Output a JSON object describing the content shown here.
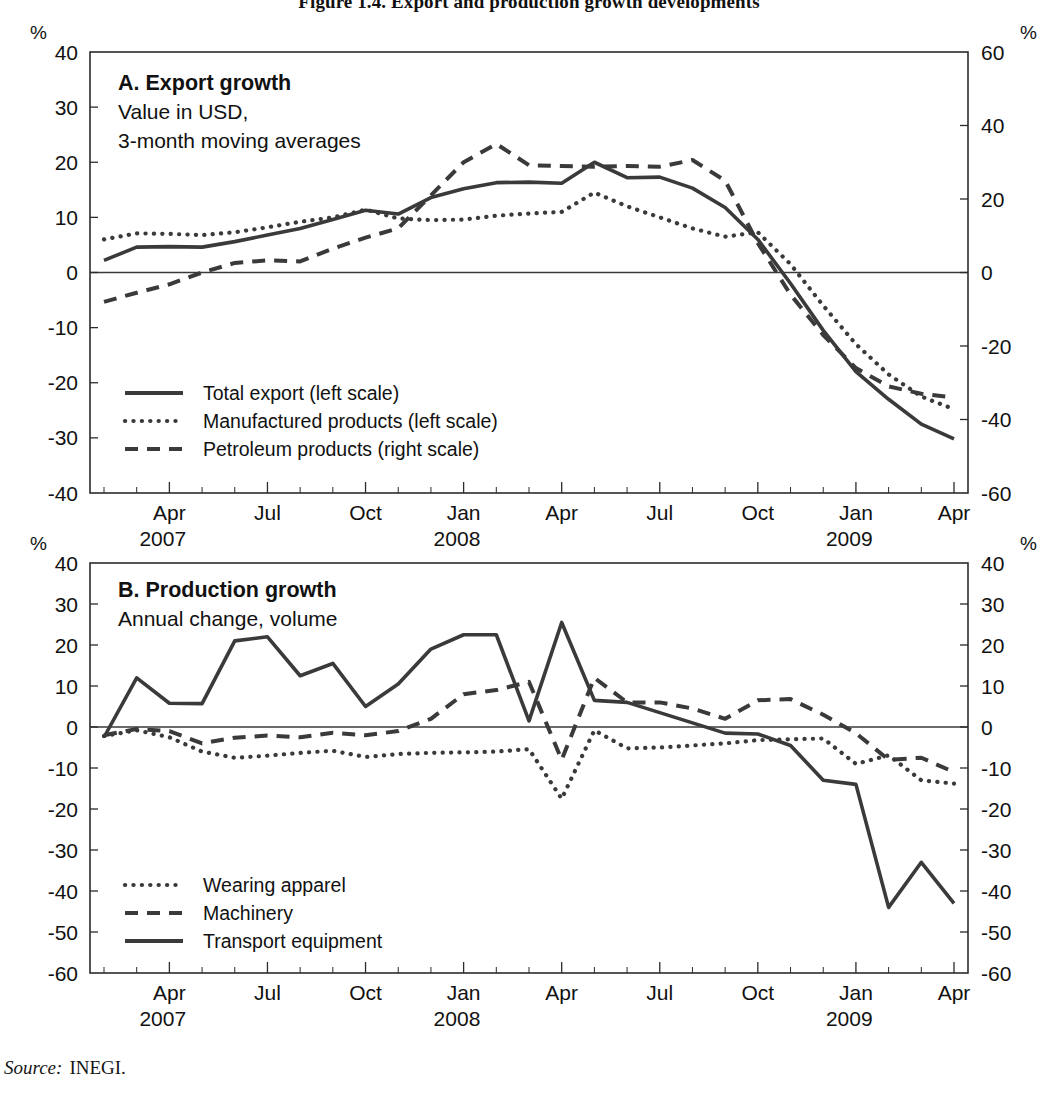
{
  "figure": {
    "title": "Figure 1.4. Export and production growth developments",
    "source_label": "Source:",
    "source_value": "INEGI."
  },
  "axis_unit": "%",
  "x_ticks": [
    "Apr",
    "Jul",
    "Oct",
    "Jan",
    "Apr",
    "Jul",
    "Oct",
    "Jan",
    "Apr"
  ],
  "years": [
    "2007",
    "2008",
    "2009"
  ],
  "chart_data": [
    {
      "type": "line",
      "panel": "A",
      "title": "A. Export growth",
      "subtitle_lines": [
        "Value in USD,",
        "3-month moving averages"
      ],
      "xlabel": "",
      "ylabel": "%",
      "y2label": "%",
      "ylim": [
        -40,
        40
      ],
      "y2lim": [
        -60,
        60
      ],
      "yticks": [
        40,
        30,
        20,
        10,
        0,
        -10,
        -20,
        -30,
        -40
      ],
      "y2ticks": [
        60,
        40,
        20,
        0,
        -20,
        -40,
        -60
      ],
      "grid": false,
      "legend_position": "inside-bottom-left",
      "x": [
        "2007-02",
        "2007-03",
        "2007-04",
        "2007-05",
        "2007-06",
        "2007-07",
        "2007-08",
        "2007-09",
        "2007-10",
        "2007-11",
        "2007-12",
        "2008-01",
        "2008-02",
        "2008-03",
        "2008-04",
        "2008-05",
        "2008-06",
        "2008-07",
        "2008-08",
        "2008-09",
        "2008-10",
        "2008-11",
        "2008-12",
        "2009-01",
        "2009-02",
        "2009-03",
        "2009-04"
      ],
      "series": [
        {
          "name": "Total export (left scale)",
          "style": "solid",
          "scale": "left",
          "values": [
            2.2,
            4.6,
            4.7,
            4.6,
            5.6,
            6.8,
            8.0,
            9.6,
            11.3,
            10.6,
            13.6,
            15.2,
            16.3,
            16.4,
            16.2,
            20.0,
            17.2,
            17.3,
            15.3,
            11.8,
            6.0,
            -2.0,
            -10.5,
            -18.0,
            -23.0,
            -27.5,
            -30.2
          ]
        },
        {
          "name": "Manufactured products (left scale)",
          "style": "dotted",
          "scale": "left",
          "values": [
            6.0,
            7.1,
            7.0,
            6.8,
            7.3,
            8.2,
            9.2,
            10.0,
            11.4,
            9.8,
            9.5,
            9.6,
            10.3,
            10.7,
            11.0,
            14.5,
            12.0,
            10.0,
            8.0,
            6.5,
            7.3,
            1.5,
            -6.0,
            -13.0,
            -18.5,
            -22.5,
            -24.8
          ]
        },
        {
          "name": "Petroleum products (right scale)",
          "style": "dashed",
          "scale": "right",
          "values": [
            -8.0,
            -5.5,
            -3.2,
            0.0,
            2.6,
            3.3,
            3.0,
            6.5,
            9.5,
            12.0,
            21.0,
            30.0,
            35.0,
            29.2,
            29.0,
            28.8,
            29.0,
            28.8,
            30.6,
            25.0,
            8.0,
            -6.0,
            -17.0,
            -26.0,
            -31.0,
            -33.0,
            -34.0
          ]
        }
      ]
    },
    {
      "type": "line",
      "panel": "B",
      "title": "B. Production growth",
      "subtitle_lines": [
        "Annual change, volume"
      ],
      "xlabel": "",
      "ylabel": "%",
      "y2label": "%",
      "ylim": [
        -60,
        40
      ],
      "y2lim": [
        -60,
        40
      ],
      "yticks": [
        40,
        30,
        20,
        10,
        0,
        -10,
        -20,
        -30,
        -40,
        -50,
        -60
      ],
      "y2ticks": [
        40,
        30,
        20,
        10,
        0,
        -10,
        -20,
        -30,
        -40,
        -50,
        -60
      ],
      "grid": false,
      "legend_position": "inside-bottom-left",
      "x": [
        "2007-02",
        "2007-03",
        "2007-04",
        "2007-05",
        "2007-06",
        "2007-07",
        "2007-08",
        "2007-09",
        "2007-10",
        "2007-11",
        "2007-12",
        "2008-01",
        "2008-02",
        "2008-03",
        "2008-04",
        "2008-05",
        "2008-06",
        "2008-07",
        "2008-08",
        "2008-09",
        "2008-10",
        "2008-11",
        "2008-12",
        "2009-01",
        "2009-02",
        "2009-03",
        "2009-04"
      ],
      "series": [
        {
          "name": "Wearing apparel",
          "style": "dotted",
          "scale": "left",
          "values": [
            -2.2,
            -0.8,
            -2.5,
            -6.0,
            -7.5,
            -7.0,
            -6.3,
            -5.8,
            -7.3,
            -6.6,
            -6.3,
            -6.2,
            -6.0,
            -5.4,
            -17.5,
            -0.8,
            -5.2,
            -5.0,
            -4.5,
            -4.0,
            -3.2,
            -3.0,
            -2.8,
            -9.0,
            -6.9,
            -13.0,
            -13.8
          ]
        },
        {
          "name": "Machinery",
          "style": "dashed",
          "scale": "left",
          "values": [
            -2.0,
            -0.5,
            -1.0,
            -4.0,
            -2.6,
            -2.1,
            -2.5,
            -1.4,
            -2.0,
            -1.0,
            2.0,
            8.0,
            9.0,
            11.0,
            -8.0,
            12.0,
            6.0,
            6.0,
            4.5,
            2.0,
            6.5,
            6.8,
            3.0,
            -1.5,
            -8.0,
            -7.5,
            -11.0
          ]
        },
        {
          "name": "Transport equipment",
          "style": "solid",
          "scale": "left",
          "values": [
            -2.5,
            12.0,
            5.8,
            5.7,
            21.0,
            22.0,
            12.5,
            15.5,
            5.0,
            10.5,
            19.0,
            22.5,
            22.5,
            1.5,
            25.5,
            6.5,
            6.0,
            3.5,
            1.0,
            -1.5,
            -1.7,
            -4.5,
            -13.0,
            -14.0,
            -44.0,
            -33.0,
            -43.0
          ]
        }
      ]
    }
  ]
}
